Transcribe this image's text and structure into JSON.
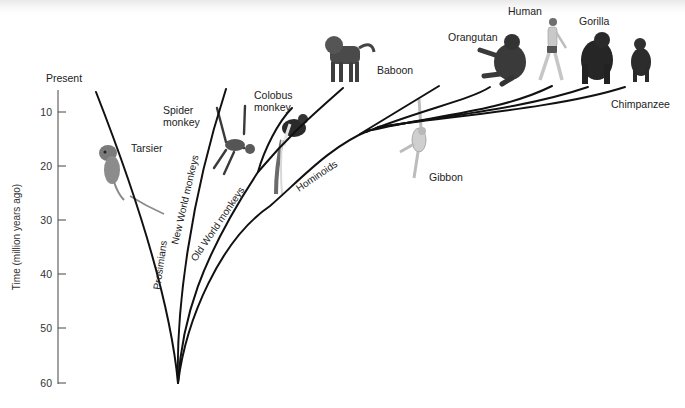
{
  "axis": {
    "title": "Time (million years ago)",
    "top_label": "Present",
    "ticks": [
      "10",
      "20",
      "30",
      "40",
      "50",
      "60"
    ]
  },
  "branches": {
    "prosimians": "Prosimians",
    "new_world": "New World monkeys",
    "old_world": "Old World monkeys",
    "hominoids": "Hominoids"
  },
  "animals": {
    "tarsier": "Tarsier",
    "spider_monkey_line1": "Spider",
    "spider_monkey_line2": "monkey",
    "colobus_line1": "Colobus",
    "colobus_line2": "monkey",
    "baboon": "Baboon",
    "gibbon": "Gibbon",
    "orangutan": "Orangutan",
    "human": "Human",
    "gorilla": "Gorilla",
    "chimpanzee": "Chimpanzee"
  },
  "colors": {
    "line": "#111111",
    "axis": "#444444",
    "text": "#222222"
  }
}
